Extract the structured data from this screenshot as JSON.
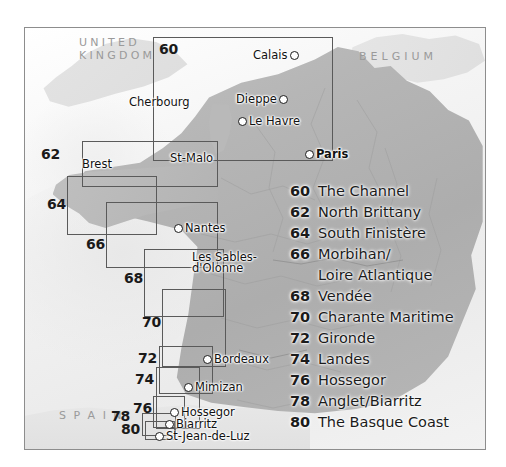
{
  "map": {
    "countries": [
      {
        "name": "UNITED\nKINGDOM",
        "id": "united-kingdom"
      },
      {
        "name": "BELGIUM",
        "id": "belgium"
      },
      {
        "name": "S P A I N",
        "id": "spain"
      }
    ],
    "cities": [
      {
        "name": "Calais",
        "bold": false
      },
      {
        "name": "Dieppe",
        "bold": false
      },
      {
        "name": "Le Havre",
        "bold": false
      },
      {
        "name": "Cherbourg",
        "bold": false
      },
      {
        "name": "Paris",
        "bold": true
      },
      {
        "name": "St-Malo",
        "bold": false
      },
      {
        "name": "Brest",
        "bold": false
      },
      {
        "name": "Nantes",
        "bold": false
      },
      {
        "name": "Les Sables-\nd'Olonne",
        "bold": false
      },
      {
        "name": "Bordeaux",
        "bold": false
      },
      {
        "name": "Mimizan",
        "bold": false
      },
      {
        "name": "Hossegor",
        "bold": false
      },
      {
        "name": "Biarritz",
        "bold": false
      },
      {
        "name": "St-Jean-de-Luz",
        "bold": false
      }
    ],
    "index_box_numbers": [
      "60",
      "62",
      "64",
      "66",
      "68",
      "70",
      "72",
      "74",
      "76",
      "78",
      "80"
    ]
  },
  "legend": {
    "entries": [
      {
        "number": "60",
        "label": "The Channel"
      },
      {
        "number": "62",
        "label": "North Brittany"
      },
      {
        "number": "64",
        "label": "South Finistère"
      },
      {
        "number": "66",
        "label": "Morbihan/\nLoire Atlantique"
      },
      {
        "number": "68",
        "label": "Vendée"
      },
      {
        "number": "70",
        "label": "Charante Maritime"
      },
      {
        "number": "72",
        "label": "Gironde"
      },
      {
        "number": "74",
        "label": "Landes"
      },
      {
        "number": "76",
        "label": "Hossegor"
      },
      {
        "number": "78",
        "label": "Anglet/Biarritz"
      },
      {
        "number": "80",
        "label": "The Basque Coast"
      }
    ]
  },
  "colors": {
    "land": "#b6b6b6",
    "sea": "#f2f2f2",
    "neighbour_land": "#e2e2e2",
    "box_stroke": "#5a5a5a",
    "frame": "#8d8d8d",
    "text": "#1b1b1b",
    "country_text": "#9a9a9a"
  }
}
